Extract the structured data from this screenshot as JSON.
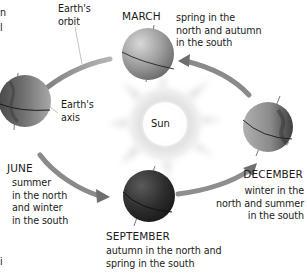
{
  "diagram": {
    "center": {
      "label": "Sun"
    },
    "labels": {
      "orbit": "Earth's\norbit",
      "orbit_line1": "Earth's",
      "orbit_line2": "orbit",
      "axis_line1": "Earth's",
      "axis_line2": "axis"
    },
    "positions": [
      {
        "month": "MARCH",
        "description_lines": [
          "spring in the",
          "north and autumn",
          "in the south"
        ]
      },
      {
        "month": "JUNE",
        "description_lines": [
          "summer",
          "in the north",
          "and winter",
          "in the south"
        ]
      },
      {
        "month": "SEPTEMBER",
        "description_lines": [
          "autumn in the north and",
          "spring in the south"
        ]
      },
      {
        "month": "DECEMBER",
        "description_lines": [
          "winter in the",
          "north and summer",
          "in the south"
        ]
      }
    ],
    "cropped_fragments": {
      "top_left_1": "n",
      "top_left_2": "l",
      "bottom_left": "i"
    },
    "colors": {
      "arrow": "#8a8a8a",
      "globe_light": "#b8b8b8",
      "globe_dark": "#3a3a3a",
      "sun_glow": "#d8d8d8",
      "text": "#1a1a1a"
    }
  }
}
